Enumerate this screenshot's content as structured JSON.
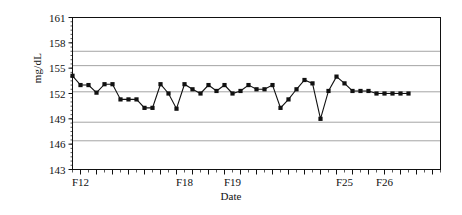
{
  "chart_data": {
    "type": "line",
    "title": "",
    "subtitle": "",
    "xlabel": "Date",
    "ylabel": "mg/dL",
    "ylim": [
      143,
      161
    ],
    "ytick_values": [
      143,
      146,
      149,
      152,
      155,
      158,
      161
    ],
    "ytick_labels": [
      "143",
      "146",
      "149",
      "152",
      "155",
      "158",
      "161"
    ],
    "xtick_labels": [
      "F12",
      "F18",
      "F19",
      "F25",
      "F26"
    ],
    "xtick_label_positions": [
      1,
      14,
      20,
      34,
      39
    ],
    "minor_tick_count": 46,
    "grid": true,
    "grid_orientation": "horizontal",
    "gridline_values": [
      157.0,
      155.3,
      152.2,
      148.6,
      146.4
    ],
    "legend": "none",
    "marker": "filled-square",
    "marker_color": "#111111",
    "line_color": "#111111",
    "series": [
      {
        "name": "mg/dL",
        "x": [
          0,
          1,
          2,
          3,
          4,
          5,
          6,
          7,
          8,
          9,
          10,
          11,
          12,
          13,
          14,
          15,
          16,
          17,
          18,
          19,
          20,
          21,
          22,
          23,
          24,
          25,
          26,
          27,
          28,
          29,
          30,
          31,
          32,
          33,
          34,
          35,
          36,
          37,
          38,
          39,
          40,
          41,
          42
        ],
        "values": [
          154.1,
          153.0,
          153.0,
          152.1,
          153.1,
          153.1,
          151.3,
          151.3,
          151.3,
          150.3,
          150.3,
          153.1,
          152.0,
          150.2,
          153.1,
          152.5,
          152.0,
          153.0,
          152.3,
          153.0,
          152.0,
          152.3,
          153.0,
          152.5,
          152.5,
          153.0,
          150.3,
          151.3,
          152.5,
          153.6,
          153.2,
          149.0,
          152.3,
          154.0,
          153.2,
          152.3,
          152.3,
          152.3,
          152.0,
          152.0,
          152.0,
          152.0,
          152.0
        ]
      }
    ]
  },
  "axes": {
    "y_axis_name": "mg-dL-axis",
    "x_axis_name": "date-axis"
  }
}
